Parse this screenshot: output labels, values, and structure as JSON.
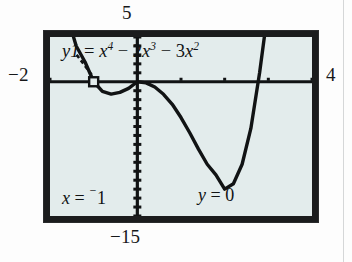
{
  "figure": {
    "kind": "graphing-calculator-screen",
    "device_screen_bg": "#e3ecec",
    "bezel_color": "#1b1c1d",
    "ink_color": "#111314"
  },
  "range_labels": {
    "top": "5",
    "left": "−2",
    "right": "4",
    "bottom": "−15"
  },
  "equation": {
    "lhs": "y1",
    "equals": "=",
    "term1_base": "x",
    "term1_exp": "4",
    "op1": "−",
    "term2_coef": "2",
    "term2_base": "x",
    "term2_exp": "3",
    "op2": "−",
    "term3_coef": "3",
    "term3_base": "x",
    "term3_exp": "2",
    "full_text": "y1 = x⁴ − 2x³ − 3x²"
  },
  "trace_readout": {
    "x_var": "x",
    "x_equals": "=",
    "x_negsign": "⁻",
    "x_value": "1",
    "y_var": "y",
    "y_equals": "=",
    "y_value": "0"
  },
  "chart_data": {
    "type": "line",
    "xlabel": "",
    "ylabel": "",
    "xlim": [
      -2,
      4
    ],
    "ylim": [
      -15,
      5
    ],
    "grid": false,
    "legend": null,
    "axes": {
      "x_axis_at_y": 0,
      "y_axis_at_x": 0,
      "x_tick_spacing": 1,
      "y_tick_spacing": 1
    },
    "annotations": [
      {
        "kind": "trace-cursor",
        "x": -1,
        "y": 0,
        "label": "x = ⁻1, y = 0"
      },
      {
        "kind": "leader-line",
        "from": "equation-label",
        "to": "trace-cursor"
      }
    ],
    "roots": [
      -1,
      0,
      3
    ],
    "series": [
      {
        "name": "y1 = x^4 - 2x^3 - 3x^2",
        "x": [
          -2.0,
          -1.8,
          -1.6,
          -1.4,
          -1.2,
          -1.0,
          -0.8,
          -0.6,
          -0.4,
          -0.2,
          0.0,
          0.2,
          0.4,
          0.6,
          0.8,
          1.0,
          1.2,
          1.4,
          1.6,
          1.8,
          2.0,
          2.2,
          2.4,
          2.6,
          2.8,
          3.0,
          3.2,
          3.4,
          3.6
        ],
        "y": [
          20.0,
          12.44,
          7.27,
          4.0,
          2.24,
          0.0,
          -1.07,
          -1.38,
          -1.19,
          -0.74,
          0.0,
          -0.13,
          -0.59,
          -1.4,
          -2.52,
          -4.0,
          -5.7,
          -7.53,
          -9.22,
          -10.4,
          -12.0,
          -11.4,
          -9.22,
          -5.22,
          1.0,
          9.0,
          19.66,
          33.76,
          52.01
        ]
      }
    ]
  }
}
